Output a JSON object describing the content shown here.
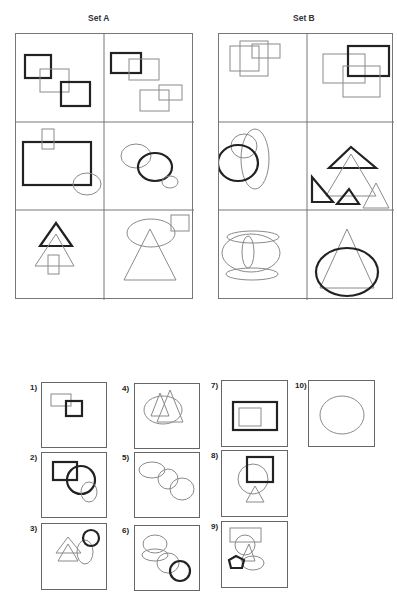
{
  "set_a": {
    "title": "Set A",
    "cells": [
      {
        "id": "a1",
        "description": "two thick squares joined by a thin overlapping rectangle"
      },
      {
        "id": "a2",
        "description": "thick rectangle overlapping thin rectangle; two thin rectangles overlapping"
      },
      {
        "id": "a3",
        "description": "large thick rectangle with thin small rectangle on top edge and thin ellipse at corner"
      },
      {
        "id": "a4",
        "description": "thick circle overlapping thin ellipse and small thin ellipse"
      },
      {
        "id": "a5",
        "description": "thick triangle over thin triangle with thin rectangle"
      },
      {
        "id": "a6",
        "description": "thin large triangle with thin ellipse and thin square"
      }
    ]
  },
  "set_b": {
    "title": "Set B",
    "cells": [
      {
        "id": "b1",
        "description": "three thin overlapping rectangles"
      },
      {
        "id": "b2",
        "description": "thick rectangle overlapping two thin rectangles"
      },
      {
        "id": "b3",
        "description": "thick circle with thin tall ellipse and thin circle"
      },
      {
        "id": "b4",
        "description": "thick triangles with thin triangles"
      },
      {
        "id": "b5",
        "description": "thin ellipses stacked: flat ellipses, round ellipse, tall thin ellipse"
      },
      {
        "id": "b6",
        "description": "thick ellipse overlapping thin triangle"
      }
    ]
  },
  "answers": [
    {
      "label": "1)",
      "description": "thin rectangle overlapping thick square"
    },
    {
      "label": "2)",
      "description": "thick rectangle, thick circle, thin ellipse"
    },
    {
      "label": "3)",
      "description": "two thin triangles, thin ellipse, thick circle"
    },
    {
      "label": "4)",
      "description": "thin ellipse with two thin triangles"
    },
    {
      "label": "5)",
      "description": "three thin ellipses in diagonal chain"
    },
    {
      "label": "6)",
      "description": "thin ellipses chain ending in thick circle"
    },
    {
      "label": "7)",
      "description": "thick rectangle containing thin rectangle"
    },
    {
      "label": "8)",
      "description": "thick square, thin circle, thin triangle"
    },
    {
      "label": "9)",
      "description": "thin rectangle, thin circle, thin triangle, thin ellipse, thick pentagon"
    },
    {
      "label": "10)",
      "description": "single thin ellipse"
    }
  ]
}
